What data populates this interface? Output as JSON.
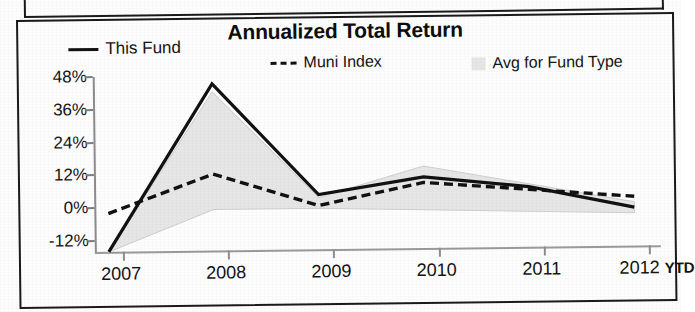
{
  "chart": {
    "title": "Annualized Total Return",
    "legend": [
      {
        "label": "This Fund",
        "marker": "solid-line-swatch",
        "color": "#111111"
      },
      {
        "label": "Muni Index",
        "marker": "dashed-line-swatch",
        "color": "#111111"
      },
      {
        "label": "Avg for Fund Type",
        "marker": "shaded-area-swatch",
        "color": "#e6e6e6"
      }
    ],
    "y_ticks": [
      "48%",
      "36%",
      "24%",
      "12%",
      "0%",
      "-12%"
    ],
    "x_ticks": [
      "2007",
      "2008",
      "2009",
      "2010",
      "2011",
      "2012"
    ],
    "x_suffix": "YTD"
  },
  "chart_data": {
    "type": "line",
    "title": "Annualized Total Return",
    "xlabel": "",
    "ylabel": "",
    "categories": [
      "2007",
      "2008",
      "2009",
      "2010",
      "2011",
      "2012"
    ],
    "x_axis_note": "YTD",
    "ylim": [
      -16,
      48
    ],
    "ytick_values": [
      48,
      36,
      24,
      12,
      0,
      -12
    ],
    "ytick_labels": [
      "48%",
      "36%",
      "24%",
      "12%",
      "0%",
      "-12%"
    ],
    "grid": false,
    "legend_position": "top",
    "series": [
      {
        "name": "This Fund",
        "style": "solid",
        "color": "#111111",
        "values": [
          -16,
          45,
          4,
          10,
          6,
          -2
        ]
      },
      {
        "name": "Muni Index",
        "style": "dashed",
        "color": "#111111",
        "values": [
          -2,
          12,
          0,
          8,
          5,
          2
        ]
      },
      {
        "name": "Avg for Fund Type",
        "style": "band",
        "color": "#e6e6e6",
        "upper": [
          -16,
          42,
          3,
          14,
          7,
          0
        ],
        "lower": [
          -16,
          -1,
          -1,
          -2,
          -3,
          -4
        ]
      }
    ]
  }
}
